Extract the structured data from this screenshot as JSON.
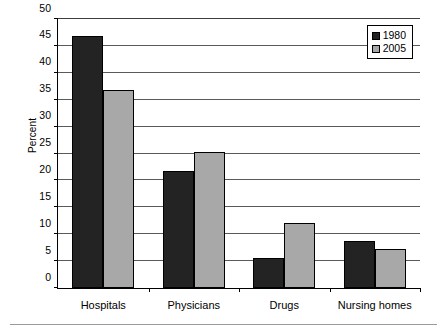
{
  "chart_data": {
    "type": "bar",
    "title": "",
    "subtitle": "",
    "xlabel": "",
    "ylabel": "Percent",
    "categories": [
      "Hospitals",
      "Physicians",
      "Drugs",
      "Nursing homes"
    ],
    "series": [
      {
        "name": "1980",
        "color": "#232323",
        "values": [
          46.9,
          21.8,
          5.5,
          8.7
        ]
      },
      {
        "name": "2005",
        "color": "#a8a8a8",
        "values": [
          36.8,
          25.3,
          12.0,
          7.2
        ]
      }
    ],
    "ylim": [
      0,
      50
    ],
    "ytick_step": 5,
    "ytick_labels": [
      "0",
      "5",
      "10",
      "15",
      "20",
      "25",
      "30",
      "35",
      "40",
      "45",
      "50"
    ],
    "grid": "horizontal",
    "legend_position": "top-right"
  },
  "legend": {
    "entries": [
      {
        "label": "1980"
      },
      {
        "label": "2005"
      }
    ]
  }
}
